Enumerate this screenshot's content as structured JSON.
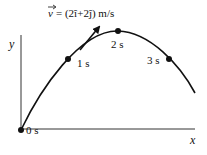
{
  "diagram": {
    "velocity_label": "v = (2î+2ĵ) m/s",
    "velocity_symbol": "v",
    "velocity_expr": "= (2î+2ĵ) m/s",
    "y_axis_label": "y",
    "x_axis_label": "x",
    "points": [
      {
        "label": "0 s",
        "x": 21,
        "y": 130
      },
      {
        "label": "1 s",
        "x": 68,
        "y": 59
      },
      {
        "label": "2 s",
        "x": 118,
        "y": 31
      },
      {
        "label": "3 s",
        "x": 169,
        "y": 59
      }
    ]
  }
}
